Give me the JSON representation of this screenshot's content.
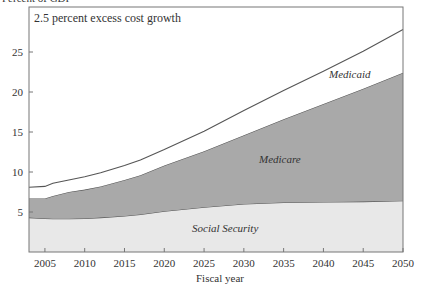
{
  "chart_data": {
    "type": "area",
    "stacked": true,
    "title": "2.5 percent excess cost growth",
    "ylabel": "Percent of GDP",
    "xlabel": "Fiscal year",
    "xlim": [
      2003,
      2050
    ],
    "ylim": [
      0,
      30
    ],
    "x_ticks": [
      2005,
      2010,
      2015,
      2020,
      2025,
      2030,
      2035,
      2040,
      2045,
      2050
    ],
    "y_ticks": [
      5,
      10,
      15,
      20,
      25
    ],
    "grid": false,
    "x": [
      2003,
      2005,
      2006,
      2008,
      2010,
      2012,
      2015,
      2017,
      2020,
      2025,
      2030,
      2035,
      2040,
      2045,
      2050
    ],
    "series": [
      {
        "name": "Social Security",
        "cumulative": [
          4.3,
          4.2,
          4.15,
          4.15,
          4.2,
          4.3,
          4.5,
          4.7,
          5.1,
          5.6,
          6.0,
          6.2,
          6.25,
          6.3,
          6.4
        ],
        "color": "#e8e8e8"
      },
      {
        "name": "Medicare",
        "cumulative": [
          6.7,
          6.7,
          7.0,
          7.5,
          7.8,
          8.2,
          9.0,
          9.6,
          10.8,
          12.6,
          14.6,
          16.6,
          18.5,
          20.4,
          22.4
        ],
        "color": "#a9a9a9"
      },
      {
        "name": "Medicaid",
        "cumulative": [
          8.1,
          8.2,
          8.6,
          9.0,
          9.4,
          9.9,
          10.8,
          11.5,
          12.8,
          15.1,
          17.7,
          20.2,
          22.6,
          25.1,
          27.8
        ],
        "color": "#ffffff"
      }
    ],
    "annotations": [
      "Medicaid",
      "Medicare",
      "Social Security"
    ]
  },
  "labels": {
    "ylabel": "Percent of GDP",
    "title": "2.5 percent excess cost growth",
    "xlabel": "Fiscal year",
    "medicaid": "Medicaid",
    "medicare": "Medicare",
    "social_security": "Social Security"
  }
}
